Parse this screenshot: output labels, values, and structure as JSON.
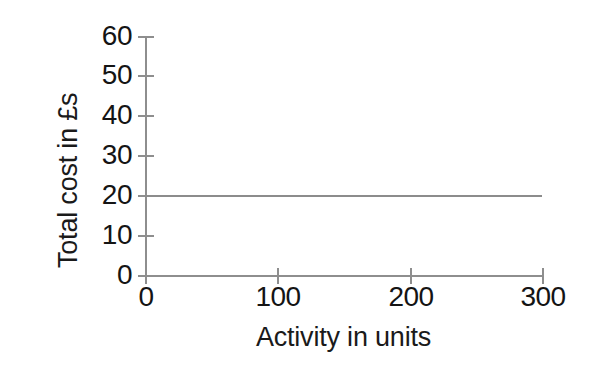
{
  "chart_data": {
    "type": "line",
    "title": "",
    "subtitle": "",
    "xlabel": "Activity in units",
    "ylabel": "Total cost in £s",
    "xlim": [
      0,
      300
    ],
    "ylim": [
      0,
      60
    ],
    "xticks": [
      0,
      100,
      200,
      300
    ],
    "xticklabels": [
      "0",
      "100",
      "200",
      "300"
    ],
    "yticks": [
      0,
      10,
      20,
      30,
      40,
      50,
      60
    ],
    "yticklabels": [
      "0",
      "10",
      "20",
      "30",
      "40",
      "50",
      "60"
    ],
    "grid": false,
    "legend": false,
    "legend_position": "none",
    "annotations": [],
    "series": [
      {
        "name": "Total cost",
        "x": [
          0,
          300
        ],
        "values": [
          20,
          20
        ],
        "color": "#8c8c8c",
        "style": "solid",
        "width": 2
      }
    ]
  },
  "figure": {
    "background_color": "#ffffff",
    "axis_color": "#8e8e8e",
    "text_color": "#141414"
  }
}
